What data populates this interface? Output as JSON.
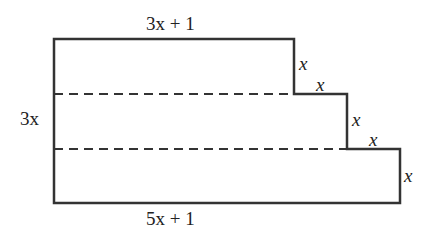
{
  "diagram": {
    "type": "staircase-shape",
    "labels": {
      "top": "3x + 1",
      "left": "3x",
      "bottom": "5x + 1",
      "step1_vertical": "x",
      "step1_horizontal": "x",
      "step2_vertical": "x",
      "step2_horizontal": "x",
      "right": "x"
    },
    "stroke_color": "#333333"
  }
}
